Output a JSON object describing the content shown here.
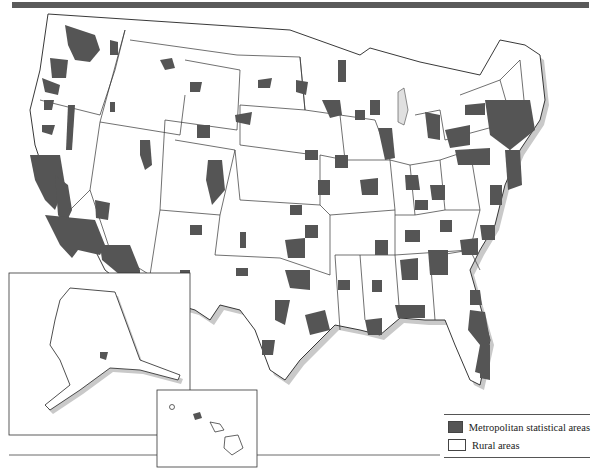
{
  "map": {
    "subject": "United States",
    "insets": [
      "Alaska",
      "Hawaii"
    ],
    "colors": {
      "metro": "#555555",
      "rural": "#ffffff",
      "border": "#222222",
      "coast_shadow": "#c8c8c8",
      "header_bar": "#5a5a5a"
    }
  },
  "legend": {
    "items": [
      {
        "label": "Metropolitan statistical areas",
        "color": "#555555"
      },
      {
        "label": "Rural areas",
        "color": "#ffffff"
      }
    ]
  }
}
